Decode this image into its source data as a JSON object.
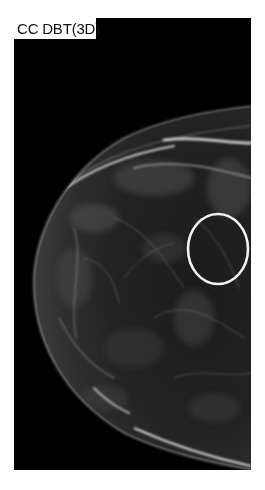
{
  "view_label": "CC DBT(3D)",
  "image": {
    "modality": "mammogram",
    "background_color": "#000000",
    "tissue_color": "#8a8a8a"
  },
  "annotation": {
    "shape": "ellipse",
    "color": "#f2f2f2"
  }
}
